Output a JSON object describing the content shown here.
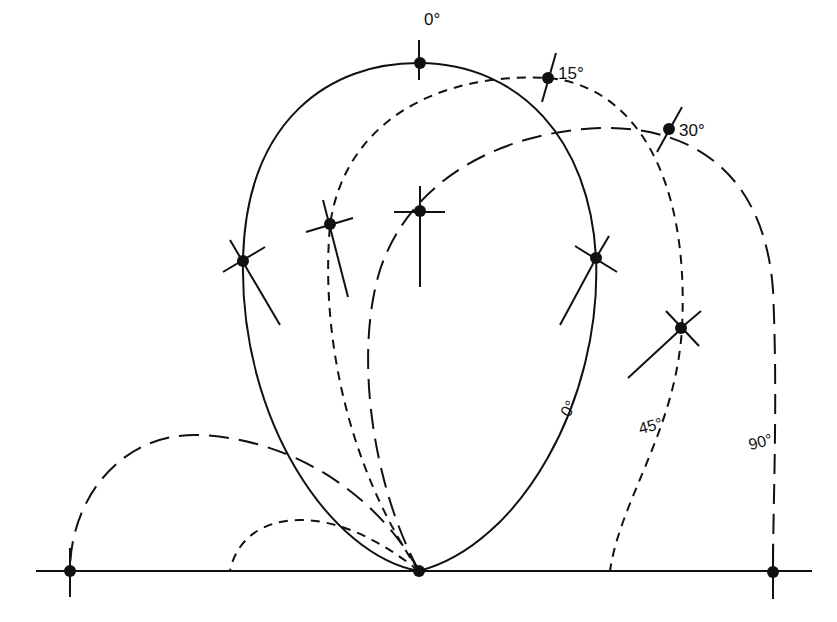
{
  "diagram": {
    "type": "polar-lobe-diagram",
    "colors": {
      "ink": "#111111",
      "background": "#ffffff"
    },
    "top_labels": [
      {
        "id": "label-0deg-top",
        "text": "0°",
        "x": 426,
        "y": 27
      },
      {
        "id": "label-15deg-top",
        "text": "15°",
        "x": 560,
        "y": 80
      },
      {
        "id": "label-30deg-top",
        "text": "30°",
        "x": 680,
        "y": 136
      }
    ],
    "curve_labels": [
      {
        "id": "label-0deg-curve",
        "text": "0°",
        "x": 562,
        "y": 415,
        "rotate": -60
      },
      {
        "id": "label-45deg-curve",
        "text": "45°",
        "x": 638,
        "y": 432,
        "rotate": -15
      },
      {
        "id": "label-90deg-curve",
        "text": "90°",
        "x": 748,
        "y": 448,
        "rotate": -15
      }
    ],
    "curves": [
      {
        "id": "curve-0deg",
        "style": "solid",
        "label": "0°"
      },
      {
        "id": "curve-45deg",
        "style": "short-dash",
        "label": "45°"
      },
      {
        "id": "curve-90deg",
        "style": "long-dash",
        "label": "90°"
      }
    ],
    "baseline": {
      "y": 571,
      "x1": 36,
      "x2": 812
    }
  }
}
